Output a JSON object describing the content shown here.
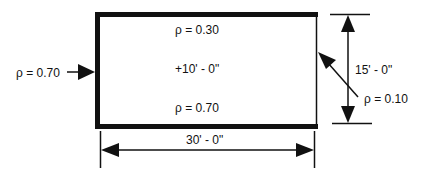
{
  "diagram": {
    "type": "room-section-reflectance",
    "colors": {
      "stroke": "#111111",
      "background": "#ffffff"
    },
    "labels": {
      "ceiling_reflectance": "ρ  = 0.30",
      "work_plane_height": "+10' - 0\"",
      "floor_reflectance": "ρ  = 0.70",
      "left_wall_reflectance": "ρ  = 0.70",
      "right_wall_reflectance": "ρ  = 0.10",
      "height_dimension": "15' - 0\"",
      "width_dimension": "30' - 0\""
    }
  }
}
